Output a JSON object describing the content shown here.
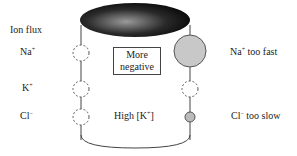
{
  "labels": {
    "ion_flux": "Ion flux",
    "na": "Na",
    "k": "K",
    "cl": "Cl",
    "plus": "+",
    "minus": "−",
    "more_negative_line1": "More",
    "more_negative_line2": "negative",
    "high_k_prefix": "High [K",
    "high_k_suffix": "]",
    "na_too_fast_suffix": " too fast",
    "cl_too_slow_suffix": " too slow"
  },
  "colors": {
    "cylinder_top_dark": "#111111",
    "cylinder_top_light": "#8a8a8a",
    "channel_fill": "#c8c8c8",
    "line": "#444444"
  }
}
